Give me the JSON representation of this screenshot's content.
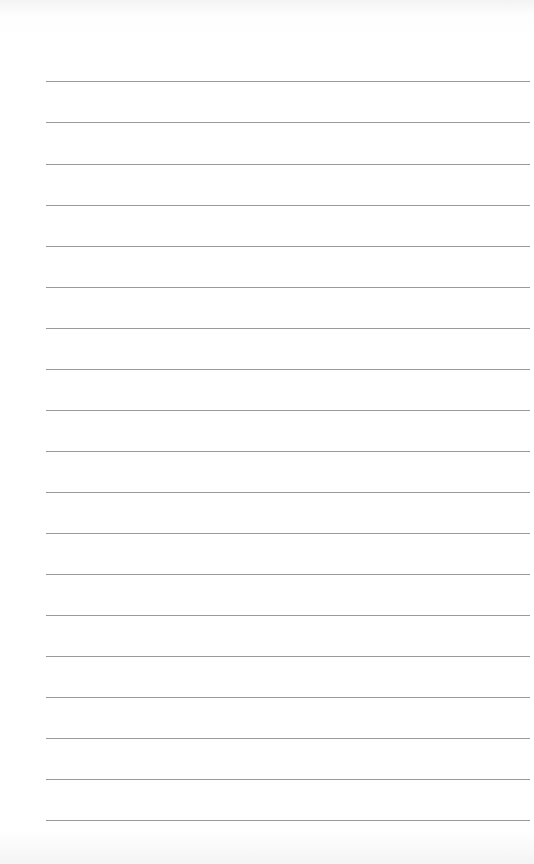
{
  "page": {
    "type": "blank-lined-paper",
    "line_count": 19,
    "line_color": "#9a9a9a",
    "background": "#ffffff",
    "lines_y": [
      81,
      122,
      164,
      205,
      246,
      287,
      328,
      369,
      410,
      451,
      492,
      533,
      574,
      615,
      656,
      697,
      738,
      779,
      820
    ]
  }
}
